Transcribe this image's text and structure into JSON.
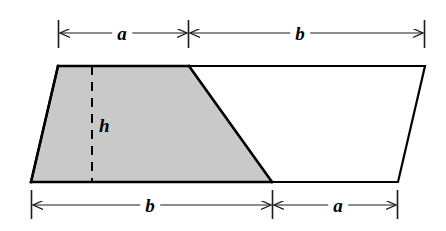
{
  "figure": {
    "colors": {
      "shading": "#c9c9c9",
      "outline": "#000000",
      "dimension_line": "#1a1a1a",
      "background": "#ffffff"
    },
    "labels": {
      "top_left": "a",
      "top_right": "b",
      "bottom_left": "b",
      "bottom_right": "a",
      "height": "h"
    },
    "geometry": {
      "parallelogram": [
        [
          58,
          66
        ],
        [
          425,
          66
        ],
        [
          398,
          182
        ],
        [
          31,
          182
        ]
      ],
      "shaded_trapezoid": [
        [
          58,
          66
        ],
        [
          189,
          66
        ],
        [
          272,
          182
        ],
        [
          31,
          182
        ]
      ],
      "height_line": {
        "x": 92,
        "y_top": 66,
        "y_bottom": 182
      }
    },
    "dimensions": {
      "top": {
        "y": 33,
        "tick_top": 20,
        "tick_bottom": 48,
        "segments": [
          {
            "label": "a",
            "x_start": 58,
            "x_end": 188,
            "label_x": 122
          },
          {
            "label": "b",
            "x_start": 188,
            "x_end": 425,
            "label_x": 300
          }
        ]
      },
      "bottom": {
        "y": 205,
        "tick_top": 190,
        "tick_bottom": 219,
        "segments": [
          {
            "label": "b",
            "x_start": 31,
            "x_end": 272,
            "label_x": 150
          },
          {
            "label": "a",
            "x_start": 272,
            "x_end": 398,
            "label_x": 338
          }
        ]
      }
    }
  }
}
